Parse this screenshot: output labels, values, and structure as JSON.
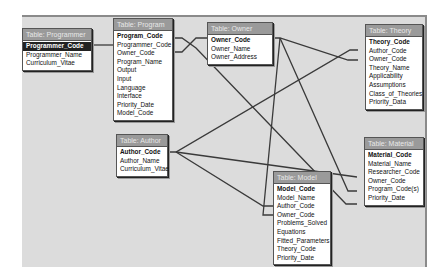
{
  "diagram": {
    "type": "relationships",
    "tables": [
      {
        "id": "programmer",
        "title": "Table: Programmer",
        "fields": [
          "Programmer_Code",
          "Programmer_Name",
          "Curriculum_Vitae"
        ],
        "primary_key": "Programmer_Code"
      },
      {
        "id": "program",
        "title": "Table: Program",
        "fields": [
          "Program_Code",
          "Programmer_Code",
          "Owner_Code",
          "Program_Name",
          "Output",
          "Input",
          "Language",
          "Interface",
          "Priority_Date",
          "Model_Code"
        ],
        "primary_key": "Program_Code"
      },
      {
        "id": "owner",
        "title": "Table: Owner",
        "fields": [
          "Owner_Code",
          "Owner_Name",
          "Owner_Address"
        ],
        "primary_key": "Owner_Code"
      },
      {
        "id": "theory",
        "title": "Table: Theory",
        "fields": [
          "Theory_Code",
          "Author_Code",
          "Owner_Code",
          "Theory_Name",
          "Applicability",
          "Assumptions",
          "Class_of_Theories",
          "Priority_Data"
        ],
        "primary_key": "Theory_Code"
      },
      {
        "id": "author",
        "title": "Table: Author",
        "fields": [
          "Author_Code",
          "Author_Name",
          "Curriculum_Vitae"
        ],
        "primary_key": "Author_Code"
      },
      {
        "id": "material",
        "title": "Table: Material",
        "fields": [
          "Material_Code",
          "Material_Name",
          "Researcher_Code",
          "Owner_Code",
          "Program_Code(s)",
          "Priority_Date"
        ],
        "primary_key": "Material_Code"
      },
      {
        "id": "model",
        "title": "Table: Model",
        "fields": [
          "Model_Code",
          "Model_Name",
          "Author_Code",
          "Owner_Code",
          "Problems_Solved",
          "Equations",
          "Fitted_Parameters",
          "Theory_Code",
          "Priority_Date"
        ],
        "primary_key": "Model_Code"
      }
    ],
    "relationships": [
      {
        "from": "Programmer.Programmer_Code",
        "to": "Program.Programmer_Code"
      },
      {
        "from": "Owner.Owner_Code",
        "to": "Program.Owner_Code"
      },
      {
        "from": "Program.Program_Code",
        "to": "Material.Program_Code(s)"
      },
      {
        "from": "Owner.Owner_Code",
        "to": "Theory.Owner_Code"
      },
      {
        "from": "Owner.Owner_Code",
        "to": "Material.Owner_Code"
      },
      {
        "from": "Owner.Owner_Code",
        "to": "Model.Owner_Code"
      },
      {
        "from": "Author.Author_Code",
        "to": "Theory.Author_Code"
      },
      {
        "from": "Author.Author_Code",
        "to": "Material.Researcher_Code"
      },
      {
        "from": "Author.Author_Code",
        "to": "Model.Author_Code"
      }
    ]
  }
}
